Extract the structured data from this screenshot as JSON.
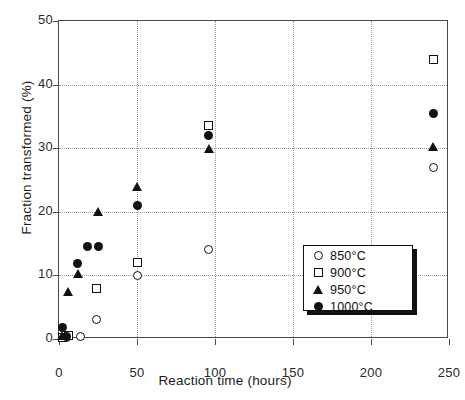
{
  "chart_data": {
    "type": "scatter",
    "title": "",
    "xlabel": "Reaction time   (hours)",
    "ylabel": "Fraction transformed   (%)",
    "xlim": [
      0,
      250
    ],
    "ylim": [
      0,
      50
    ],
    "xticks": [
      0,
      50,
      100,
      150,
      200,
      250
    ],
    "yticks": [
      0,
      10,
      20,
      30,
      40,
      50
    ],
    "grid": true,
    "legend_position": "lower right",
    "series": [
      {
        "name": "850°C",
        "marker": "open-circle",
        "color": "#111111",
        "points": [
          {
            "x": 2,
            "y": 0.2
          },
          {
            "x": 5,
            "y": 0.3
          },
          {
            "x": 14,
            "y": 0.4
          },
          {
            "x": 24,
            "y": 3.0
          },
          {
            "x": 50,
            "y": 10.0
          },
          {
            "x": 96,
            "y": 14.0
          },
          {
            "x": 240,
            "y": 27.0
          }
        ]
      },
      {
        "name": "900°C",
        "marker": "open-square",
        "color": "#111111",
        "points": [
          {
            "x": 2,
            "y": 0.3
          },
          {
            "x": 6,
            "y": 0.5
          },
          {
            "x": 24,
            "y": 8.0
          },
          {
            "x": 50,
            "y": 12.0
          },
          {
            "x": 96,
            "y": 33.5
          },
          {
            "x": 240,
            "y": 44.0
          }
        ]
      },
      {
        "name": "950°C",
        "marker": "filled-triangle",
        "color": "#111111",
        "points": [
          {
            "x": 2,
            "y": 0.5
          },
          {
            "x": 6,
            "y": 7.5
          },
          {
            "x": 12,
            "y": 10.3
          },
          {
            "x": 25,
            "y": 20.0
          },
          {
            "x": 50,
            "y": 24.0
          },
          {
            "x": 96,
            "y": 30.0
          },
          {
            "x": 240,
            "y": 30.2
          }
        ]
      },
      {
        "name": "1000°C",
        "marker": "filled-circle",
        "color": "#111111",
        "points": [
          {
            "x": 2,
            "y": 1.8
          },
          {
            "x": 5,
            "y": 0.4
          },
          {
            "x": 12,
            "y": 11.8
          },
          {
            "x": 18,
            "y": 14.5
          },
          {
            "x": 25,
            "y": 14.6
          },
          {
            "x": 50,
            "y": 21.0
          },
          {
            "x": 96,
            "y": 32.0
          },
          {
            "x": 240,
            "y": 35.5
          }
        ]
      }
    ]
  }
}
